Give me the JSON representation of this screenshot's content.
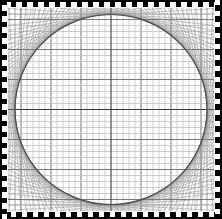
{
  "figure": {
    "title": "",
    "width": 222,
    "height": 219,
    "background_color": "#ffffff"
  },
  "frame": {
    "name": "dashed-border",
    "color": "#000000",
    "thickness_px": 7,
    "dash_period_px": 11,
    "style": "alternating-dash"
  },
  "plot_area": {
    "left": 8,
    "top": 8,
    "width": 206,
    "height": 203
  },
  "chart_data": {
    "type": "line",
    "title": "",
    "subtitle": "",
    "xlabel": "",
    "ylabel": "",
    "xlim": [
      0,
      206
    ],
    "ylim": [
      0,
      203
    ],
    "grid": true,
    "legend": null,
    "legend_position": "none",
    "tick_labels_x": [],
    "tick_labels_y": [],
    "annotations": [],
    "series": [
      {
        "name": "minor-grid",
        "kind": "grid",
        "spacing_px": 6.0,
        "color": "#b9b9b9",
        "width_px": 0.7
      },
      {
        "name": "major-grid",
        "kind": "grid",
        "spacing_px": 30.0,
        "color": "#6a6a6a",
        "width_px": 0.9
      },
      {
        "name": "center-axes",
        "kind": "axis",
        "x_center_px": 103,
        "y_center_px": 101.5,
        "color": "#3a3a3a",
        "width_px": 1.1
      },
      {
        "name": "string-envelope",
        "kind": "envelope",
        "chord_count": 112,
        "color": "#7d7d7d",
        "width_px": 0.55,
        "opacity": 0.75
      },
      {
        "name": "inscribed-circle",
        "kind": "circle",
        "center_x_px": 103,
        "center_y_px": 101.5,
        "radius_x_px": 96,
        "radius_y_px": 95,
        "color": "#4a4a4a",
        "width_px": 1.2
      }
    ]
  }
}
